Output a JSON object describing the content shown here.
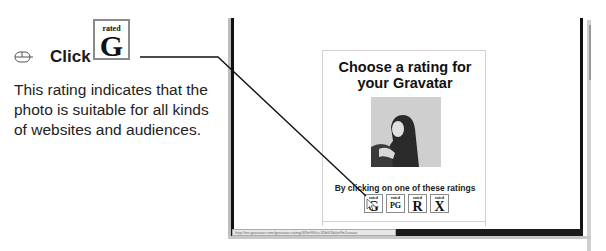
{
  "instruction": {
    "action_icon": "mouse-icon",
    "action_label": "Click",
    "badge": {
      "small": "rated",
      "big": "G"
    },
    "description": "This rating indicates that the photo is suitable for all kinds of websites and audiences."
  },
  "browser": {
    "status_url": "http://en.gravatar.com/gravatar-rating/4f3e9f0fcc32b0f1b0ef9e1cwaiu"
  },
  "panel": {
    "title": "Choose a rating for your Gravatar",
    "avatar_alt": "profile photo",
    "prompt": "By clicking on one of these ratings",
    "ratings": [
      {
        "small": "rated",
        "big": "G"
      },
      {
        "small": "rated",
        "big": "PG"
      },
      {
        "small": "rated",
        "big": "R"
      },
      {
        "small": "rated",
        "big": "X"
      }
    ]
  },
  "colors": {
    "frame": "#111111",
    "badge_border": "#8a8a8a",
    "text": "#1a1a1a"
  }
}
